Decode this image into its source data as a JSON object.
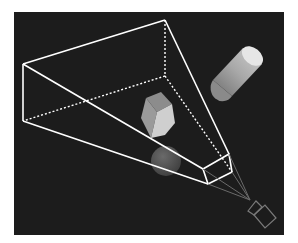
{
  "diagram": {
    "background": "#1a1a1a",
    "frustum_color": "#ffffff",
    "camera_color": "#7a7a7a",
    "objects": [
      "cylinder",
      "cube",
      "sphere",
      "camera"
    ]
  }
}
